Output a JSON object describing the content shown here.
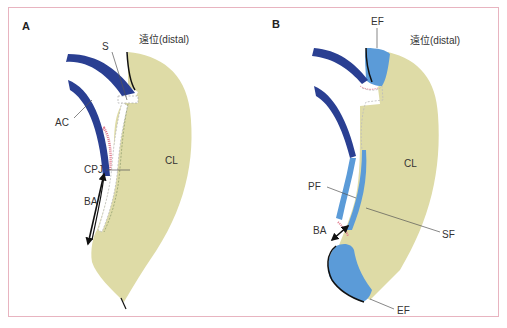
{
  "figure": {
    "border_color": "#e8b4c0",
    "colors": {
      "connective_tissue": "#dedba6",
      "enamel_dark_blue": "#2a3f92",
      "fiber_light_blue": "#5b9bd8",
      "junction_pink": "#e07a8c",
      "outline": "#111111"
    }
  },
  "panel_a": {
    "letter": "A",
    "direction_label": "遠位(distal)",
    "labels": {
      "s": "S",
      "ac": "AC",
      "cpj": "CPJ",
      "ba": "BA",
      "cl": "CL"
    }
  },
  "panel_b": {
    "letter": "B",
    "direction_label": "遠位(distal)",
    "labels": {
      "ef_top": "EF",
      "pf": "PF",
      "cl": "CL",
      "sf": "SF",
      "ba": "BA",
      "ef_bottom": "EF"
    }
  }
}
